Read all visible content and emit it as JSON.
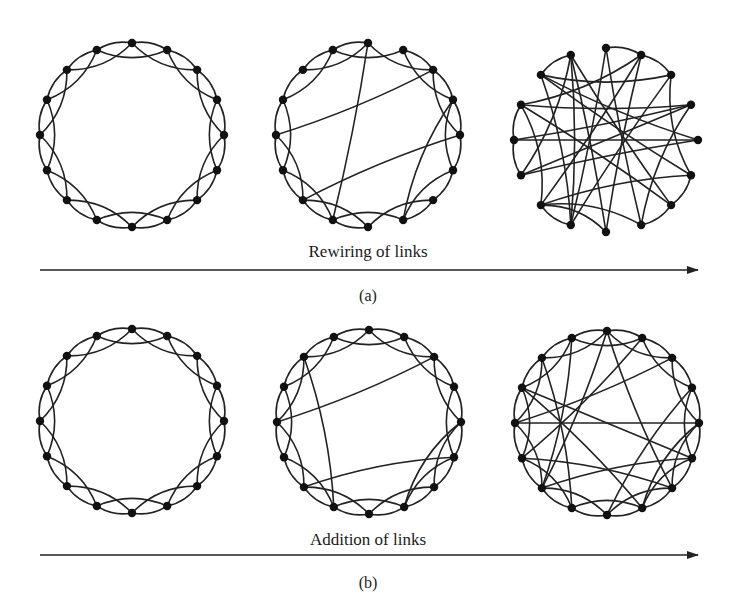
{
  "figure": {
    "panel_a": {
      "process_label": "Rewiring of links",
      "caption": "(a)",
      "graphs": [
        {
          "name": "regular-ring-lattice",
          "cx": 132,
          "cy": 135,
          "r": 92,
          "nodes": 16,
          "shortcuts": []
        },
        {
          "name": "small-world-rewired",
          "cx": 368,
          "cy": 135,
          "r": 92,
          "nodes": 16,
          "removed": [
            [
              0,
              1
            ],
            [
              4,
              6
            ],
            [
              12,
              14
            ],
            [
              7,
              8
            ]
          ],
          "shortcuts": [
            [
              0,
              9
            ],
            [
              2,
              12
            ],
            [
              4,
              10
            ],
            [
              3,
              7
            ]
          ]
        },
        {
          "name": "random-rewired",
          "cx": 606,
          "cy": 140,
          "r": 92,
          "nodes": 16,
          "random": true,
          "edges": [
            [
              0,
              1
            ],
            [
              0,
              7
            ],
            [
              0,
              9
            ],
            [
              1,
              2
            ],
            [
              1,
              13
            ],
            [
              1,
              10
            ],
            [
              2,
              5
            ],
            [
              2,
              14
            ],
            [
              2,
              9
            ],
            [
              3,
              12
            ],
            [
              3,
              7
            ],
            [
              3,
              11
            ],
            [
              4,
              11
            ],
            [
              4,
              12
            ],
            [
              4,
              14
            ],
            [
              5,
              14
            ],
            [
              5,
              6
            ],
            [
              5,
              10
            ],
            [
              6,
              7
            ],
            [
              6,
              13
            ],
            [
              8,
              15
            ],
            [
              8,
              10
            ],
            [
              8,
              1
            ],
            [
              9,
              10
            ],
            [
              10,
              13
            ],
            [
              11,
              12
            ],
            [
              11,
              15
            ],
            [
              12,
              13
            ],
            [
              13,
              3
            ],
            [
              14,
              15
            ],
            [
              15,
              6
            ],
            [
              15,
              9
            ],
            [
              7,
              10
            ],
            [
              9,
              14
            ]
          ]
        }
      ]
    },
    "panel_b": {
      "process_label": "Addition of links",
      "caption": "(b)",
      "graphs": [
        {
          "name": "regular-ring-lattice",
          "cx": 132,
          "cy": 421,
          "r": 92,
          "nodes": 16,
          "shortcuts": []
        },
        {
          "name": "small-world-added",
          "cx": 369,
          "cy": 422,
          "r": 92,
          "nodes": 16,
          "shortcuts": [
            [
              2,
              12
            ],
            [
              14,
              9
            ],
            [
              5,
              10
            ],
            [
              4,
              7
            ]
          ]
        },
        {
          "name": "denser-small-world",
          "cx": 607,
          "cy": 423,
          "r": 92,
          "nodes": 16,
          "shortcuts": [
            [
              2,
              12
            ],
            [
              14,
              9
            ],
            [
              5,
              10
            ],
            [
              4,
              7
            ],
            [
              3,
              8
            ],
            [
              13,
              5
            ],
            [
              12,
              4
            ],
            [
              11,
              6
            ],
            [
              10,
              15
            ],
            [
              0,
              10
            ],
            [
              1,
              11
            ],
            [
              6,
              0
            ],
            [
              7,
              13
            ]
          ]
        }
      ]
    }
  }
}
